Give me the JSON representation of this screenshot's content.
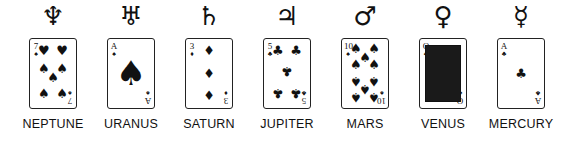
{
  "planets": [
    {
      "name": "NEPTUNE",
      "symbol": "♆",
      "rank": "7",
      "suit": "♠",
      "suit_label": "spades",
      "center": 53,
      "pips": [
        [
          30,
          18,
          "♥",
          0
        ],
        [
          70,
          18,
          "♥",
          0
        ],
        [
          30,
          44,
          "♠",
          0
        ],
        [
          70,
          44,
          "♠",
          0
        ],
        [
          50,
          57,
          "♠",
          0
        ],
        [
          30,
          80,
          "♠",
          0
        ],
        [
          70,
          80,
          "♠",
          0
        ]
      ],
      "top_suit": "♥"
    },
    {
      "name": "URANUS",
      "symbol": "♅",
      "rank": "A",
      "suit": "♠",
      "suit_label": "spades",
      "center": 131,
      "pips": [
        [
          50,
          50,
          "♠",
          2
        ]
      ],
      "top_suit": "♠"
    },
    {
      "name": "SATURN",
      "symbol": "♄",
      "rank": "3",
      "suit": "♦",
      "suit_label": "diamonds",
      "center": 209,
      "pips": [
        [
          50,
          18,
          "♦",
          0
        ],
        [
          50,
          50,
          "♦",
          0
        ],
        [
          50,
          82,
          "♦",
          0
        ]
      ],
      "top_suit": "♦"
    },
    {
      "name": "JUPITER",
      "symbol": "♃",
      "rank": "5",
      "suit": "♣",
      "suit_label": "clubs",
      "center": 287,
      "pips": [
        [
          30,
          18,
          "♣",
          0
        ],
        [
          70,
          18,
          "♣",
          0
        ],
        [
          50,
          48,
          "♣",
          1
        ],
        [
          30,
          80,
          "♣",
          1
        ],
        [
          70,
          80,
          "♣",
          1
        ]
      ],
      "top_suit": "♣"
    },
    {
      "name": "MARS",
      "symbol": "♂",
      "rank": "10",
      "suit": "♠",
      "suit_label": "spades",
      "center": 365,
      "pips": [
        [
          30,
          15,
          "♠",
          0
        ],
        [
          50,
          27,
          "♠",
          0
        ],
        [
          70,
          15,
          "♠",
          0
        ],
        [
          30,
          38,
          "♠",
          0
        ],
        [
          70,
          38,
          "♠",
          0
        ],
        [
          30,
          62,
          "♠",
          1
        ],
        [
          70,
          62,
          "♠",
          1
        ],
        [
          50,
          74,
          "♠",
          1
        ],
        [
          30,
          86,
          "♠",
          1
        ],
        [
          70,
          86,
          "♠",
          1
        ]
      ],
      "top_suit": "♠"
    },
    {
      "name": "VENUS",
      "symbol": "♀",
      "rank": "Q",
      "suit": "♣",
      "suit_label": "clubs",
      "center": 443,
      "pips": [],
      "court": true,
      "top_suit": "♣"
    },
    {
      "name": "MERCURY",
      "symbol": "☿",
      "rank": "A",
      "suit": "♣",
      "suit_label": "clubs",
      "center": 521,
      "pips": [
        [
          50,
          50,
          "♣",
          0
        ]
      ],
      "top_suit": "♣"
    }
  ]
}
